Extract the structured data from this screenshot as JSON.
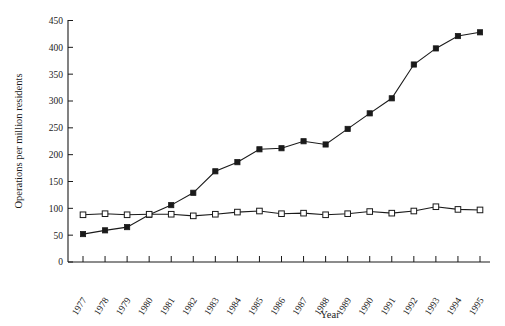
{
  "chart_data": {
    "type": "line",
    "title": "",
    "xlabel": "Year",
    "ylabel": "Operations per million residents",
    "categories": [
      "1977",
      "1978",
      "1979",
      "1980",
      "1981",
      "1982",
      "1983",
      "1984",
      "1985",
      "1986",
      "1987",
      "1988",
      "1989",
      "1990",
      "1991",
      "1992",
      "1993",
      "1994",
      "1995"
    ],
    "x": [
      1977,
      1978,
      1979,
      1980,
      1981,
      1982,
      1983,
      1984,
      1985,
      1986,
      1987,
      1988,
      1989,
      1990,
      1991,
      1992,
      1993,
      1994,
      1995
    ],
    "xlim": [
      1977,
      1995
    ],
    "ylim": [
      0,
      450
    ],
    "yticks": [
      0,
      50,
      100,
      150,
      200,
      250,
      300,
      350,
      400,
      450
    ],
    "ytick_labels": [
      "0",
      "50",
      "100",
      "150",
      "200",
      "250",
      "300",
      "350",
      "400",
      "450"
    ],
    "grid": false,
    "legend": "none",
    "series": [
      {
        "name": "filled-square-series",
        "marker": "filled-square",
        "color": "#1a1a1a",
        "values": [
          52,
          59,
          65,
          88,
          106,
          129,
          169,
          186,
          210,
          212,
          225,
          219,
          248,
          277,
          305,
          368,
          398,
          421,
          428
        ]
      },
      {
        "name": "open-square-series",
        "marker": "open-square",
        "color": "#1a1a1a",
        "values": [
          88,
          90,
          88,
          89,
          89,
          86,
          89,
          93,
          95,
          90,
          91,
          88,
          90,
          94,
          91,
          95,
          103,
          98,
          97
        ]
      }
    ]
  },
  "axes": {
    "y_axis_title": "Operations per million residents",
    "x_axis_title": "Year"
  }
}
